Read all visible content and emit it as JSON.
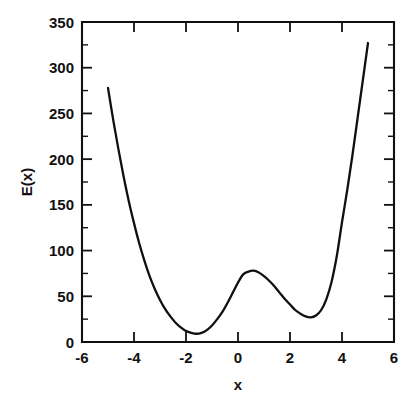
{
  "chart_data": {
    "type": "line",
    "title": "",
    "xlabel": "x",
    "ylabel": "E(x)",
    "xlim": [
      -6,
      6
    ],
    "ylim": [
      0,
      350
    ],
    "grid": false,
    "legend": null,
    "x_ticks": [
      -6,
      -4,
      -2,
      0,
      2,
      4,
      6
    ],
    "x_tick_labels": [
      "-6",
      "-4",
      "-2",
      "0",
      "2",
      "4",
      "6"
    ],
    "y_ticks": [
      0,
      50,
      100,
      150,
      200,
      250,
      300,
      350
    ],
    "y_tick_labels": [
      "0",
      "50",
      "100",
      "150",
      "200",
      "250",
      "300",
      "350"
    ],
    "series": [
      {
        "name": "E(x)",
        "color": "#101010",
        "x": [
          -5.0,
          -4.8,
          -4.6,
          -4.4,
          -4.2,
          -4.0,
          -3.8,
          -3.6,
          -3.4,
          -3.2,
          -3.0,
          -2.8,
          -2.6,
          -2.4,
          -2.2,
          -2.0,
          -1.8,
          -1.6,
          -1.4,
          -1.2,
          -1.0,
          -0.8,
          -0.6,
          -0.4,
          -0.2,
          0.0,
          0.2,
          0.4,
          0.6,
          0.8,
          1.0,
          1.2,
          1.4,
          1.6,
          1.8,
          2.0,
          2.2,
          2.4,
          2.6,
          2.8,
          3.0,
          3.2,
          3.4,
          3.6,
          3.8,
          4.0,
          4.2,
          4.4,
          4.6,
          4.8,
          5.0
        ],
        "y": [
          278.0,
          243.0,
          211.0,
          181.0,
          154.0,
          130.0,
          108.0,
          89.0,
          72.0,
          58.0,
          46.0,
          36.0,
          28.0,
          21.0,
          16.0,
          12.0,
          10.0,
          9.0,
          10.0,
          13.0,
          18.0,
          25.0,
          33.0,
          43.0,
          54.0,
          65.0,
          74.0,
          77.0,
          78.0,
          76.0,
          72.0,
          67.0,
          61.0,
          54.0,
          47.0,
          41.0,
          35.0,
          31.0,
          28.0,
          27.0,
          29.0,
          35.0,
          47.0,
          66.0,
          94.0,
          131.0,
          166.0,
          204.0,
          245.0,
          286.0,
          327.0
        ],
        "annotations": {
          "left_minimum": {
            "x": -2.95,
            "y": 0
          },
          "local_maximum": {
            "x": 0.15,
            "y": 78
          },
          "right_minimum": {
            "x": 2.8,
            "y": 27
          },
          "left_endpoint": {
            "x": -5,
            "y": 278
          },
          "right_endpoint": {
            "x": 5,
            "y": 327
          }
        }
      }
    ]
  }
}
